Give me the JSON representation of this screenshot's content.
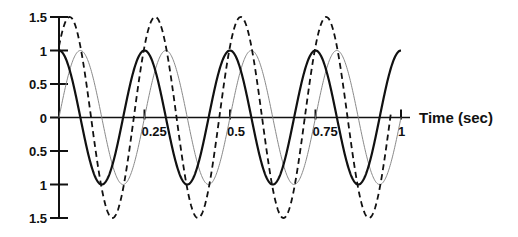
{
  "chart_data": {
    "type": "line",
    "title": "",
    "xlabel": "Time (sec)",
    "ylabel": "",
    "xlim": [
      0,
      1
    ],
    "ylim": [
      -1.5,
      1.5
    ],
    "grid": false,
    "legend": null,
    "x_ticks": [
      0.25,
      0.5,
      0.75,
      1
    ],
    "x_tick_labels": [
      "0.25",
      "0.5",
      "0.75",
      "1"
    ],
    "y_ticks": [
      1.5,
      1,
      0.5,
      0,
      -0.5,
      -1,
      -1.5
    ],
    "y_tick_labels": [
      "1.5",
      "1",
      "0.5",
      "0",
      "0.5",
      "1",
      "1.5"
    ],
    "series": [
      {
        "name": "solid (cosine)",
        "style": "solid-thick",
        "color": "#111111",
        "amplitude": 1,
        "frequency_hz": 4,
        "phase_rad": 0,
        "function": "cos",
        "t_end": 1.0,
        "x": [
          0,
          0.0625,
          0.125,
          0.1875,
          0.25,
          0.3125,
          0.375,
          0.4375,
          0.5,
          0.5625,
          0.625,
          0.6875,
          0.75,
          0.8125,
          0.875,
          0.9375,
          1.0
        ],
        "values": [
          1,
          0,
          -1,
          0,
          1,
          0,
          -1,
          0,
          1,
          0,
          -1,
          0,
          1,
          0,
          -1,
          0,
          1
        ]
      },
      {
        "name": "thin (sine)",
        "style": "solid-thin",
        "color": "#777777",
        "amplitude": 1,
        "frequency_hz": 4,
        "phase_rad": -1.5708,
        "function": "cos",
        "t_end": 1.0,
        "x": [
          0,
          0.0625,
          0.125,
          0.1875,
          0.25,
          0.3125,
          0.375,
          0.4375,
          0.5,
          0.5625,
          0.625,
          0.6875,
          0.75,
          0.8125,
          0.875,
          0.9375,
          1.0
        ],
        "values": [
          0,
          1,
          0,
          -1,
          0,
          1,
          0,
          -1,
          0,
          1,
          0,
          -1,
          0,
          1,
          0,
          -1,
          0
        ]
      },
      {
        "name": "dashed (sum)",
        "style": "dashed",
        "color": "#111111",
        "amplitude": 1.5,
        "frequency_hz": 4,
        "phase_rad": -0.7854,
        "function": "cos",
        "t_end": 0.97,
        "x": [
          0,
          0.03125,
          0.09375,
          0.15625,
          0.21875,
          0.28125,
          0.34375,
          0.40625,
          0.46875,
          0.53125,
          0.59375,
          0.65625,
          0.71875,
          0.78125,
          0.84375,
          0.90625,
          0.96875
        ],
        "values": [
          1.06,
          1.5,
          0,
          -1.5,
          0,
          1.5,
          0,
          -1.5,
          0,
          1.5,
          0,
          -1.5,
          0,
          1.5,
          0,
          -1.5,
          0
        ]
      }
    ]
  },
  "axis": {
    "xlabel": "Time (sec)"
  }
}
